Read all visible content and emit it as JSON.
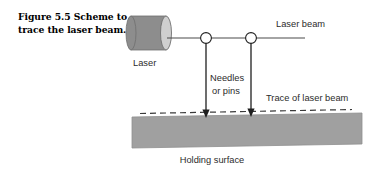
{
  "figure": {
    "caption": "Figure 5.5  Scheme to trace the laser beam.",
    "caption_line1": "Figure 5.5  Scheme to",
    "caption_line2": "trace the laser beam."
  },
  "diagram": {
    "title": "Scheme to trace the laser beam",
    "labels": {
      "laser": "Laser",
      "laser_beam": "Laser beam",
      "needles_line1": "Needles",
      "needles_line2": "or pins",
      "trace": "Trace of laser beam",
      "holding_surface": "Holding surface"
    },
    "colors": {
      "cylinder_body": "#8d8d8d",
      "cylinder_cap": "#c9c9c9",
      "slab": "#a0a0a0",
      "stroke": "#3a3a3a",
      "text": "#2b2b2b",
      "background": "#ffffff"
    },
    "geometry": {
      "laser_cylinder": {
        "x": 130,
        "y": 16,
        "width": 43,
        "height": 34
      },
      "beam_y": 38,
      "beam_x_start": 168,
      "beam_x_end": 305,
      "needle_1_x": 206,
      "needle_2_x": 251,
      "needle_radius": 5.5,
      "needle_tip_y": 117,
      "dashed_line_y": 112,
      "dashed_x_start": 140,
      "dashed_x_end": 352,
      "slab_top_left_y": 117,
      "slab_top_right_y": 113,
      "slab_x_left": 132,
      "slab_x_right": 362,
      "slab_bottom_left_y": 148,
      "slab_bottom_right_y": 144
    }
  }
}
